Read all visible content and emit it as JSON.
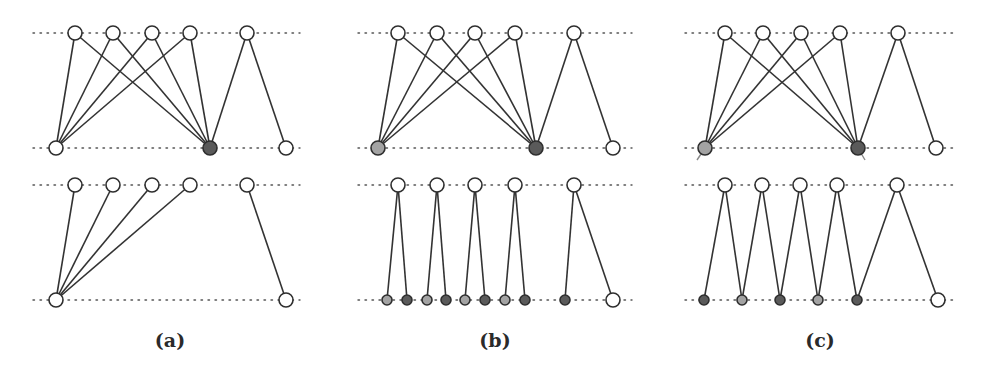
{
  "figure": {
    "colors": {
      "edge": "#333333",
      "node_stroke": "#2e2e2e",
      "white": "#ffffff",
      "dark": "#5a5a5a",
      "light": "#a3a3a3",
      "guide": "#555555"
    },
    "panels": [
      {
        "id": "a",
        "label": "(a)",
        "label_pos": [
          170,
          340
        ],
        "subgraphs": [
          {
            "guides": [
              [
                33,
                300,
                33
              ],
              [
                33,
                300,
                148
              ]
            ],
            "top_nodes": [
              {
                "x": 75,
                "y": 33,
                "fill": "white",
                "r": 7
              },
              {
                "x": 113,
                "y": 33,
                "fill": "white",
                "r": 7
              },
              {
                "x": 152,
                "y": 33,
                "fill": "white",
                "r": 7
              },
              {
                "x": 190,
                "y": 33,
                "fill": "white",
                "r": 7
              },
              {
                "x": 247,
                "y": 33,
                "fill": "white",
                "r": 7
              }
            ],
            "bottom_nodes": [
              {
                "x": 56,
                "y": 148,
                "fill": "white",
                "r": 7
              },
              {
                "x": 210,
                "y": 148,
                "fill": "dark",
                "r": 7
              },
              {
                "x": 286,
                "y": 148,
                "fill": "white",
                "r": 7
              }
            ],
            "edges": [
              [
                0,
                0
              ],
              [
                1,
                0
              ],
              [
                2,
                0
              ],
              [
                3,
                0
              ],
              [
                0,
                1
              ],
              [
                1,
                1
              ],
              [
                2,
                1
              ],
              [
                3,
                1
              ],
              [
                4,
                1
              ],
              [
                4,
                2
              ]
            ]
          },
          {
            "guides": [
              [
                33,
                300,
                185
              ],
              [
                33,
                300,
                300
              ]
            ],
            "top_nodes": [
              {
                "x": 75,
                "y": 185,
                "fill": "white",
                "r": 7
              },
              {
                "x": 113,
                "y": 185,
                "fill": "white",
                "r": 7
              },
              {
                "x": 152,
                "y": 185,
                "fill": "white",
                "r": 7
              },
              {
                "x": 190,
                "y": 185,
                "fill": "white",
                "r": 7
              },
              {
                "x": 247,
                "y": 185,
                "fill": "white",
                "r": 7
              }
            ],
            "bottom_nodes": [
              {
                "x": 56,
                "y": 300,
                "fill": "white",
                "r": 7
              },
              {
                "x": 286,
                "y": 300,
                "fill": "white",
                "r": 7
              }
            ],
            "edges": [
              [
                0,
                0
              ],
              [
                1,
                0
              ],
              [
                2,
                0
              ],
              [
                3,
                0
              ],
              [
                4,
                1
              ]
            ]
          }
        ]
      },
      {
        "id": "b",
        "label": "(b)",
        "label_pos": [
          495,
          340
        ],
        "subgraphs": [
          {
            "guides": [
              [
                358,
                632,
                33
              ],
              [
                358,
                632,
                148
              ]
            ],
            "top_nodes": [
              {
                "x": 398,
                "y": 33,
                "fill": "white",
                "r": 7
              },
              {
                "x": 437,
                "y": 33,
                "fill": "white",
                "r": 7
              },
              {
                "x": 475,
                "y": 33,
                "fill": "white",
                "r": 7
              },
              {
                "x": 515,
                "y": 33,
                "fill": "white",
                "r": 7
              },
              {
                "x": 574,
                "y": 33,
                "fill": "white",
                "r": 7
              }
            ],
            "bottom_nodes": [
              {
                "x": 378,
                "y": 148,
                "fill": "light",
                "r": 7
              },
              {
                "x": 536,
                "y": 148,
                "fill": "dark",
                "r": 7
              },
              {
                "x": 613,
                "y": 148,
                "fill": "white",
                "r": 7
              }
            ],
            "edges": [
              [
                0,
                0
              ],
              [
                1,
                0
              ],
              [
                2,
                0
              ],
              [
                3,
                0
              ],
              [
                0,
                1
              ],
              [
                1,
                1
              ],
              [
                2,
                1
              ],
              [
                3,
                1
              ],
              [
                4,
                1
              ],
              [
                4,
                2
              ]
            ]
          },
          {
            "guides": [
              [
                358,
                632,
                185
              ],
              [
                358,
                632,
                300
              ]
            ],
            "top_nodes": [
              {
                "x": 398,
                "y": 185,
                "fill": "white",
                "r": 7
              },
              {
                "x": 437,
                "y": 185,
                "fill": "white",
                "r": 7
              },
              {
                "x": 475,
                "y": 185,
                "fill": "white",
                "r": 7
              },
              {
                "x": 515,
                "y": 185,
                "fill": "white",
                "r": 7
              },
              {
                "x": 574,
                "y": 185,
                "fill": "white",
                "r": 7
              }
            ],
            "bottom_nodes": [
              {
                "x": 387,
                "y": 300,
                "fill": "light",
                "r": 5
              },
              {
                "x": 407,
                "y": 300,
                "fill": "dark",
                "r": 5
              },
              {
                "x": 427,
                "y": 300,
                "fill": "light",
                "r": 5
              },
              {
                "x": 446,
                "y": 300,
                "fill": "dark",
                "r": 5
              },
              {
                "x": 465,
                "y": 300,
                "fill": "light",
                "r": 5
              },
              {
                "x": 485,
                "y": 300,
                "fill": "dark",
                "r": 5
              },
              {
                "x": 505,
                "y": 300,
                "fill": "light",
                "r": 5
              },
              {
                "x": 525,
                "y": 300,
                "fill": "dark",
                "r": 5
              },
              {
                "x": 565,
                "y": 300,
                "fill": "dark",
                "r": 5
              },
              {
                "x": 613,
                "y": 300,
                "fill": "white",
                "r": 7
              }
            ],
            "edges": [
              [
                0,
                0
              ],
              [
                0,
                1
              ],
              [
                1,
                2
              ],
              [
                1,
                3
              ],
              [
                2,
                4
              ],
              [
                2,
                5
              ],
              [
                3,
                6
              ],
              [
                3,
                7
              ],
              [
                4,
                8
              ],
              [
                4,
                9
              ]
            ]
          }
        ]
      },
      {
        "id": "c",
        "label": "(c)",
        "label_pos": [
          820,
          340
        ],
        "subgraphs": [
          {
            "guides": [
              [
                685,
                953,
                33
              ],
              [
                685,
                953,
                148
              ]
            ],
            "top_nodes": [
              {
                "x": 725,
                "y": 33,
                "fill": "white",
                "r": 7
              },
              {
                "x": 763,
                "y": 33,
                "fill": "white",
                "r": 7
              },
              {
                "x": 801,
                "y": 33,
                "fill": "white",
                "r": 7
              },
              {
                "x": 840,
                "y": 33,
                "fill": "white",
                "r": 7
              },
              {
                "x": 898,
                "y": 33,
                "fill": "white",
                "r": 7
              }
            ],
            "bottom_nodes": [
              {
                "x": 705,
                "y": 148,
                "fill": "light",
                "r": 7
              },
              {
                "x": 858,
                "y": 148,
                "fill": "dark",
                "r": 7
              },
              {
                "x": 936,
                "y": 148,
                "fill": "white",
                "r": 7
              }
            ],
            "edges": [
              [
                0,
                0
              ],
              [
                1,
                0
              ],
              [
                2,
                0
              ],
              [
                3,
                0
              ],
              [
                0,
                1
              ],
              [
                1,
                1
              ],
              [
                2,
                1
              ],
              [
                3,
                1
              ],
              [
                4,
                1
              ],
              [
                4,
                2
              ]
            ],
            "tails": [
              [
                705,
                148,
                697,
                160
              ],
              [
                858,
                148,
                865,
                160
              ]
            ]
          },
          {
            "guides": [
              [
                685,
                953,
                185
              ],
              [
                685,
                953,
                300
              ]
            ],
            "top_nodes": [
              {
                "x": 725,
                "y": 185,
                "fill": "white",
                "r": 7
              },
              {
                "x": 762,
                "y": 185,
                "fill": "white",
                "r": 7
              },
              {
                "x": 800,
                "y": 185,
                "fill": "white",
                "r": 7
              },
              {
                "x": 837,
                "y": 185,
                "fill": "white",
                "r": 7
              },
              {
                "x": 897,
                "y": 185,
                "fill": "white",
                "r": 7
              }
            ],
            "bottom_nodes": [
              {
                "x": 704,
                "y": 300,
                "fill": "dark",
                "r": 5
              },
              {
                "x": 742,
                "y": 300,
                "fill": "light",
                "r": 5
              },
              {
                "x": 780,
                "y": 300,
                "fill": "dark",
                "r": 5
              },
              {
                "x": 818,
                "y": 300,
                "fill": "light",
                "r": 5
              },
              {
                "x": 857,
                "y": 300,
                "fill": "dark",
                "r": 5
              },
              {
                "x": 938,
                "y": 300,
                "fill": "white",
                "r": 7
              }
            ],
            "edges": [
              [
                0,
                0
              ],
              [
                0,
                1
              ],
              [
                1,
                1
              ],
              [
                1,
                2
              ],
              [
                2,
                2
              ],
              [
                2,
                3
              ],
              [
                3,
                3
              ],
              [
                3,
                4
              ],
              [
                4,
                4
              ],
              [
                4,
                5
              ]
            ]
          }
        ]
      }
    ]
  }
}
